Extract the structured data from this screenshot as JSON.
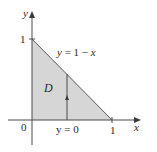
{
  "diagram": {
    "type": "region-of-integration",
    "region_label": "D",
    "axes": {
      "x_label": "x",
      "y_label": "y",
      "origin_label": "0",
      "x_tick_label": "1",
      "y_tick_label": "1"
    },
    "curves": {
      "upper_boundary": {
        "label_var": "y",
        "label_eq": "=",
        "label_expr": "1 − x"
      },
      "lower_boundary": {
        "label_var": "y",
        "label_eq": "=",
        "label_expr": "0"
      }
    },
    "vertices": [
      [
        0,
        0
      ],
      [
        1,
        0
      ],
      [
        0,
        1
      ]
    ],
    "vertical_strip_x": 0.45,
    "colors": {
      "fill": "#d6d6d6",
      "line": "#4a4a4a",
      "text": "#2a2a2a"
    }
  }
}
